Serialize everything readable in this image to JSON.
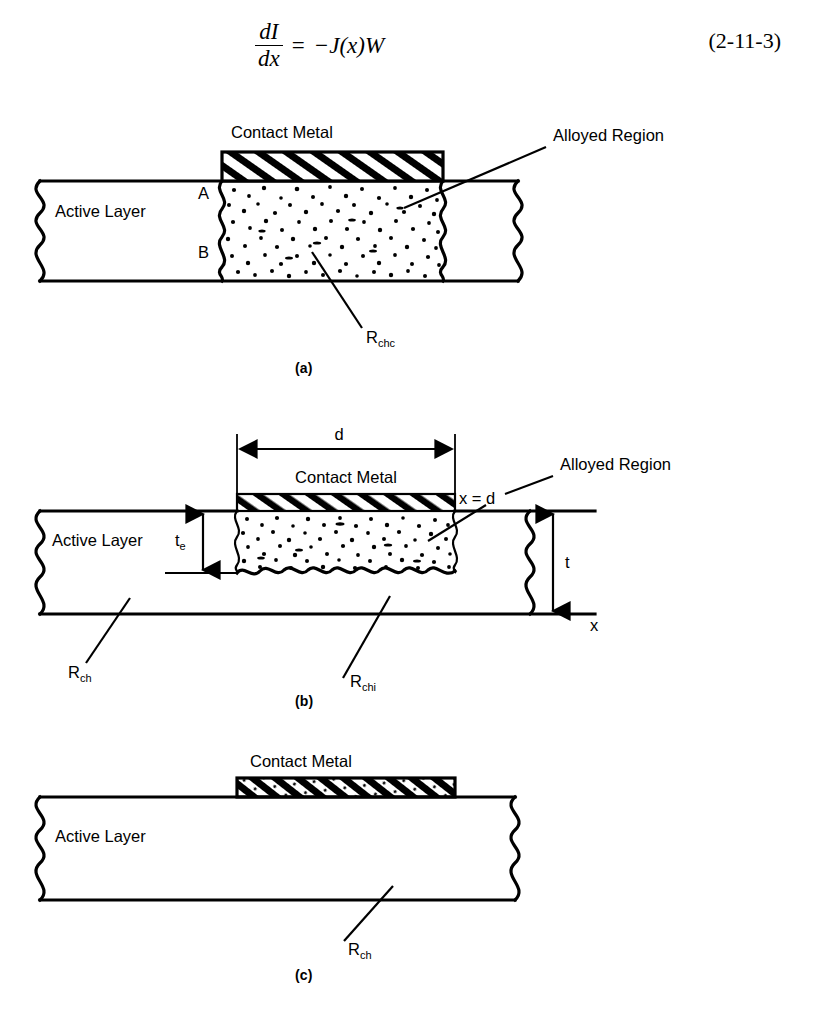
{
  "equation": {
    "numerator": "dI",
    "denominator": "dx",
    "equals": "=",
    "rhs": "−J(x)W",
    "number": "(2-11-3)"
  },
  "figures": [
    {
      "caption": "(a)",
      "labels": {
        "contact_metal": "Contact Metal",
        "alloyed_region": "Alloyed Region",
        "active_layer": "Active Layer",
        "point_a": "A",
        "point_b": "B",
        "resistance": "R",
        "resistance_sub": "chc"
      }
    },
    {
      "caption": "(b)",
      "labels": {
        "dimension_d": "d",
        "contact_metal": "Contact Metal",
        "alloyed_region": "Alloyed Region",
        "x_equals_d": "x = d",
        "active_layer": "Active Layer",
        "thickness_te": "t",
        "thickness_te_sub": "e",
        "thickness_t": "t",
        "axis_x": "x",
        "resistance_ch": "R",
        "resistance_ch_sub": "ch",
        "resistance_chi": "R",
        "resistance_chi_sub": "chi"
      }
    },
    {
      "caption": "(c)",
      "labels": {
        "contact_metal": "Contact Metal",
        "active_layer": "Active Layer",
        "resistance": "R",
        "resistance_sub": "ch"
      }
    }
  ],
  "colors": {
    "ink": "#000000",
    "paper": "#ffffff"
  }
}
